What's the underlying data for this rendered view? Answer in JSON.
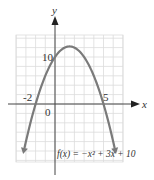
{
  "chart_data": {
    "type": "line",
    "title": "",
    "xlabel": "x",
    "ylabel": "y",
    "function_label": "f(x) = −x² + 3x + 10",
    "function": "-x^2 + 3x + 10",
    "tick_labels": {
      "x": [
        "-2",
        "5"
      ],
      "y": [
        "10"
      ],
      "origin": "0"
    },
    "x_intercepts": [
      -2,
      5
    ],
    "y_intercept": 10,
    "vertex": [
      1.5,
      12.25
    ],
    "xlim": [
      -4,
      7
    ],
    "ylim": [
      -12,
      14
    ],
    "grid": true,
    "grid_step": {
      "x": 1,
      "y": 2
    },
    "series": [
      {
        "name": "f(x)",
        "x": [
          -3.2,
          -3,
          -2,
          -1,
          0,
          1,
          1.5,
          2,
          3,
          4,
          5,
          6,
          6.2
        ],
        "y": [
          -9.84,
          -8,
          0,
          6,
          10,
          12,
          12.25,
          12,
          10,
          6,
          0,
          -8,
          -9.84
        ]
      }
    ],
    "colors": {
      "curve": "#7a7a7a",
      "axis": "#333333",
      "grid": "#d9d9d9"
    }
  }
}
